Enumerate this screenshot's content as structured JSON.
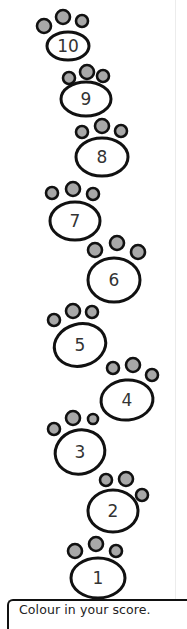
{
  "worksheet": {
    "caption": "Colour in your score.",
    "colors": {
      "outline": "#111111",
      "toe_fill": "#a8a8a8",
      "pad_fill": "#ffffff",
      "number": "#333333"
    },
    "paws": [
      {
        "label": "10",
        "pad": {
          "cx": 68,
          "cy": 46,
          "rx": 21,
          "ry": 14,
          "rot": 0
        },
        "toes": [
          [
            44,
            26,
            7
          ],
          [
            63,
            17,
            7
          ],
          [
            82,
            21,
            6
          ]
        ]
      },
      {
        "label": "9",
        "pad": {
          "cx": 86,
          "cy": 99,
          "rx": 25,
          "ry": 17,
          "rot": 0
        },
        "toes": [
          [
            69,
            78,
            6
          ],
          [
            87,
            72,
            7
          ],
          [
            103,
            76,
            6
          ]
        ]
      },
      {
        "label": "8",
        "pad": {
          "cx": 102,
          "cy": 157,
          "rx": 26,
          "ry": 19,
          "rot": 0
        },
        "toes": [
          [
            82,
            132,
            6
          ],
          [
            102,
            126,
            7
          ],
          [
            121,
            131,
            6
          ]
        ]
      },
      {
        "label": "7",
        "pad": {
          "cx": 75,
          "cy": 221,
          "rx": 25,
          "ry": 19,
          "rot": 0
        },
        "toes": [
          [
            52,
            193,
            6
          ],
          [
            73,
            189,
            7
          ],
          [
            93,
            194,
            6
          ]
        ]
      },
      {
        "label": "6",
        "pad": {
          "cx": 114,
          "cy": 280,
          "rx": 26,
          "ry": 22,
          "rot": 0
        },
        "toes": [
          [
            95,
            250,
            7
          ],
          [
            117,
            243,
            7
          ],
          [
            138,
            252,
            7
          ]
        ]
      },
      {
        "label": "5",
        "pad": {
          "cx": 80,
          "cy": 345,
          "rx": 26,
          "ry": 21,
          "rot": -15
        },
        "toes": [
          [
            54,
            320,
            6
          ],
          [
            73,
            311,
            7
          ],
          [
            92,
            312,
            6
          ]
        ]
      },
      {
        "label": "4",
        "pad": {
          "cx": 127,
          "cy": 400,
          "rx": 26,
          "ry": 20,
          "rot": -5
        },
        "toes": [
          [
            113,
            368,
            6
          ],
          [
            133,
            365,
            7
          ],
          [
            152,
            375,
            6
          ]
        ]
      },
      {
        "label": "3",
        "pad": {
          "cx": 80,
          "cy": 452,
          "rx": 25,
          "ry": 22,
          "rot": -15
        },
        "toes": [
          [
            54,
            429,
            6
          ],
          [
            73,
            418,
            7
          ],
          [
            93,
            419,
            5
          ]
        ]
      },
      {
        "label": "2",
        "pad": {
          "cx": 113,
          "cy": 511,
          "rx": 25,
          "ry": 21,
          "rot": 0
        },
        "toes": [
          [
            106,
            480,
            6
          ],
          [
            126,
            479,
            7
          ],
          [
            142,
            495,
            6
          ]
        ]
      },
      {
        "label": "1",
        "pad": {
          "cx": 98,
          "cy": 578,
          "rx": 27,
          "ry": 20,
          "rot": 0
        },
        "toes": [
          [
            75,
            551,
            7
          ],
          [
            96,
            544,
            7
          ],
          [
            116,
            551,
            6
          ]
        ]
      }
    ]
  }
}
